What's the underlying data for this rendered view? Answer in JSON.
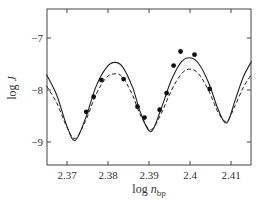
{
  "chart_data": {
    "type": "line",
    "title": "",
    "xlabel": "log n_bp",
    "xlabel_main": "log ",
    "xlabel_var": "n",
    "xlabel_sub": "bp",
    "ylabel": "log J",
    "ylabel_main": "log ",
    "ylabel_var": "J",
    "xlim": [
      2.365,
      2.415
    ],
    "ylim": [
      -9.45,
      -6.45
    ],
    "xticks": [
      2.37,
      2.38,
      2.39,
      2.4,
      2.41
    ],
    "xtick_labels": [
      "2.37",
      "2.38",
      "2.39",
      "2.4",
      "2.41"
    ],
    "yticks": [
      -7,
      -8,
      -9
    ],
    "ytick_labels": [
      "−7",
      "−8",
      "−9"
    ],
    "grid": false,
    "legend": null,
    "series": [
      {
        "name": "theory (solid)",
        "style": "solid",
        "x": [
          2.365,
          2.3675,
          2.37,
          2.372,
          2.3745,
          2.377,
          2.3795,
          2.3815,
          2.3835,
          2.386,
          2.388,
          2.3905,
          2.393,
          2.3955,
          2.398,
          2.4,
          2.402,
          2.4045,
          2.407,
          2.409,
          2.411,
          2.413,
          2.415
        ],
        "y": [
          -7.7,
          -8.1,
          -8.7,
          -8.97,
          -8.55,
          -7.95,
          -7.58,
          -7.47,
          -7.55,
          -7.95,
          -8.45,
          -8.8,
          -8.35,
          -7.8,
          -7.45,
          -7.38,
          -7.48,
          -7.85,
          -8.4,
          -8.63,
          -8.2,
          -7.75,
          -7.45
        ]
      },
      {
        "name": "theory (dashed)",
        "style": "dashed",
        "x": [
          2.365,
          2.3675,
          2.37,
          2.372,
          2.3745,
          2.377,
          2.3795,
          2.3815,
          2.3835,
          2.386,
          2.388,
          2.3905,
          2.393,
          2.3955,
          2.398,
          2.4,
          2.402,
          2.4045,
          2.407,
          2.409,
          2.411,
          2.413,
          2.415
        ],
        "y": [
          -7.92,
          -8.25,
          -8.72,
          -8.93,
          -8.6,
          -8.1,
          -7.77,
          -7.69,
          -7.75,
          -8.1,
          -8.5,
          -8.76,
          -8.45,
          -8.0,
          -7.68,
          -7.6,
          -7.68,
          -8.0,
          -8.45,
          -8.6,
          -8.3,
          -7.95,
          -7.7
        ]
      },
      {
        "name": "experiment",
        "style": "markers",
        "x": [
          2.3747,
          2.3765,
          2.3784,
          2.3838,
          2.3872,
          2.3889,
          2.3926,
          2.3943,
          2.396,
          2.3977,
          2.4011,
          2.4048
        ],
        "y": [
          -8.42,
          -8.13,
          -7.81,
          -7.79,
          -8.32,
          -8.53,
          -8.38,
          -8.06,
          -7.53,
          -7.26,
          -7.32,
          -7.98
        ]
      }
    ]
  }
}
